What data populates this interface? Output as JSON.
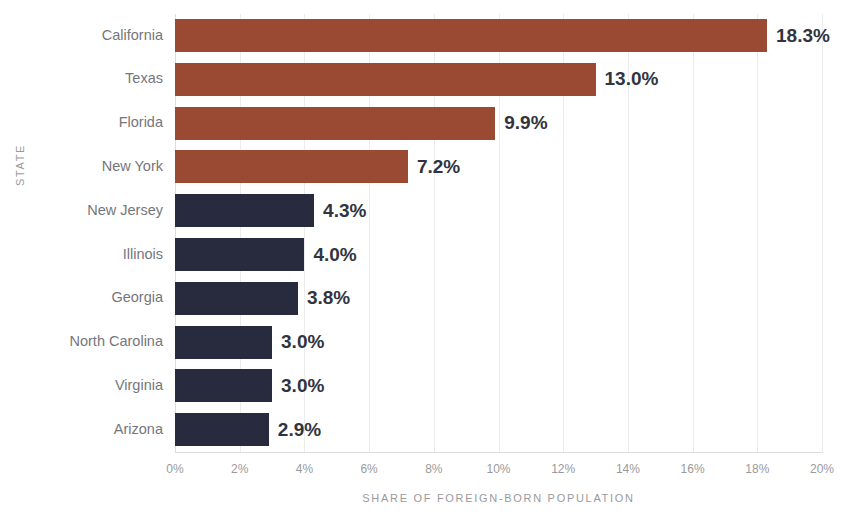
{
  "chart_data": {
    "type": "bar",
    "orientation": "horizontal",
    "title": "",
    "xlabel": "SHARE OF FOREIGN-BORN POPULATION",
    "ylabel": "STATE",
    "xlim": [
      0,
      20
    ],
    "xticks": [
      "0%",
      "2%",
      "4%",
      "6%",
      "8%",
      "10%",
      "12%",
      "14%",
      "16%",
      "18%",
      "20%"
    ],
    "xtick_values": [
      0,
      2,
      4,
      6,
      8,
      10,
      12,
      14,
      16,
      18,
      20
    ],
    "grid": true,
    "legend": "none",
    "categories": [
      "California",
      "Texas",
      "Florida",
      "New York",
      "New Jersey",
      "Illinois",
      "Georgia",
      "North Carolina",
      "Virginia",
      "Arizona"
    ],
    "values": [
      18.3,
      13.0,
      9.9,
      7.2,
      4.3,
      4.0,
      3.8,
      3.0,
      3.0,
      2.9
    ],
    "value_labels": [
      "18.3%",
      "13.0%",
      "9.9%",
      "7.2%",
      "4.3%",
      "4.0%",
      "3.8%",
      "3.0%",
      "3.0%",
      "2.9%"
    ],
    "bar_colors": [
      "#9a4a32",
      "#9a4a32",
      "#9a4a32",
      "#9a4a32",
      "#272b3d",
      "#272b3d",
      "#272b3d",
      "#272b3d",
      "#272b3d",
      "#272b3d"
    ],
    "colors": {
      "series_top": "#9a4a32",
      "series_bottom": "#272b3d",
      "gridline": "#ececed",
      "axis": "#dcdcdd",
      "tick_text": "#9a9a9d",
      "category_text": "#76767a",
      "value_text": "#31343f",
      "background": "#ffffff"
    }
  }
}
